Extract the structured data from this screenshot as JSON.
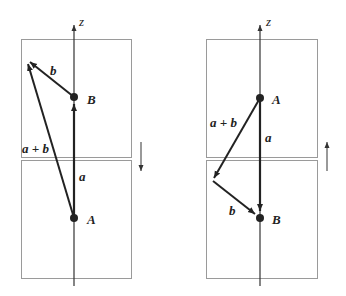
{
  "diagram": {
    "axis_label": "z",
    "left_panel": {
      "points": {
        "upper": "B",
        "lower": "A"
      },
      "vectors": {
        "a": "a",
        "b": "b",
        "sum": "a + b"
      },
      "motion_direction": "down"
    },
    "right_panel": {
      "points": {
        "upper": "A",
        "lower": "B"
      },
      "vectors": {
        "a": "a",
        "b": "b",
        "sum": "a + b"
      },
      "motion_direction": "up"
    },
    "colors": {
      "ink": "#222222",
      "box": "#9a9a9a",
      "arrow_thin": "#555555"
    }
  }
}
